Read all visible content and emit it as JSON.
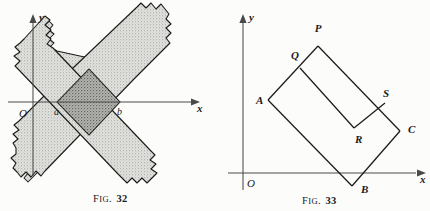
{
  "page": {
    "width": 430,
    "height": 211,
    "background": "#fcfcfa",
    "ink": "#1b1b1b"
  },
  "colors": {
    "ink": "#1b1b1b",
    "axis": "#4a4a4a",
    "strip_fill_light": "#dcdcd8",
    "strip_fill_dark": "#a9a9a6",
    "stipple_dot": "#6e6e6a"
  },
  "figures": [
    {
      "id": "fig32",
      "caption_prefix": "F",
      "caption_small": "IG.",
      "caption_number": "32",
      "caption_full": "FIG. 32",
      "axes": {
        "origin_label": "O",
        "x_label": "x",
        "y_label": "y",
        "x_axis_y": 102,
        "y_axis_x": 33,
        "x_axis_from": 8,
        "x_axis_to": 196,
        "y_axis_from": 18,
        "y_axis_to": 176
      },
      "point_labels": [
        {
          "name": "a",
          "text": "a",
          "x": 57,
          "y": 110
        },
        {
          "name": "b",
          "text": "b",
          "x": 120,
          "y": 110
        }
      ],
      "description": "Two infinite crossing diagonal strips, lightly stippled, whose overlap is a darker shaded square meeting the x-axis at a and b.",
      "geometry": {
        "strip_up": {
          "note": "strip rising to the right, corners along lines y = x + c",
          "outline": "18,60 47,31 199,22 198,76",
          "edge_low": [
            [
              18,
              60
            ],
            [
              160,
              180
            ]
          ],
          "edge_high": [
            [
              55,
              25
            ],
            [
              200,
              150
            ]
          ]
        },
        "strip_down": {
          "note": "strip falling to the right",
          "edge_low": [
            [
              55,
              180
            ],
            [
              200,
              40
            ]
          ],
          "edge_high": [
            [
              18,
              150
            ],
            [
              160,
              20
            ]
          ]
        },
        "overlap_square": [
          [
            57,
            102
          ],
          [
            89,
            69
          ],
          [
            120,
            102
          ],
          [
            89,
            135
          ]
        ]
      }
    },
    {
      "id": "fig33",
      "caption_prefix": "F",
      "caption_small": "IG.",
      "caption_number": "33",
      "caption_full": "FIG. 33",
      "axes": {
        "origin_label": "O",
        "x_label": "x",
        "y_label": "y",
        "x_axis_y": 173,
        "y_axis_x": 243,
        "x_axis_from": 228,
        "x_axis_to": 424,
        "y_axis_from": 18,
        "y_axis_to": 190
      },
      "vertices": [
        {
          "name": "P",
          "text": "P",
          "px": 318,
          "py": 46,
          "lx": 318,
          "ly": 32
        },
        {
          "name": "Q",
          "text": "Q",
          "px": 300,
          "py": 68,
          "lx": 291,
          "ly": 59
        },
        {
          "name": "A",
          "text": "A",
          "px": 268,
          "py": 100,
          "lx": 256,
          "ly": 104
        },
        {
          "name": "S",
          "text": "S",
          "px": 385,
          "py": 103,
          "lx": 383,
          "ly": 97
        },
        {
          "name": "R",
          "text": "R",
          "px": 354,
          "py": 128,
          "lx": 355,
          "ly": 143
        },
        {
          "name": "C",
          "text": "C",
          "px": 400,
          "py": 131,
          "lx": 408,
          "ly": 133
        },
        {
          "name": "B",
          "text": "B",
          "px": 352,
          "py": 186,
          "lx": 361,
          "ly": 193
        }
      ],
      "description": "A large tilted square A-P-C-B with an inner re-entrant notch Q-R-S, drawn relative to x- and y-axes with origin O.",
      "geometry": {
        "outer_path": [
          [
            268,
            100
          ],
          [
            318,
            46
          ],
          [
            400,
            131
          ],
          [
            352,
            186
          ]
        ],
        "notch_path": [
          [
            300,
            68
          ],
          [
            354,
            128
          ],
          [
            385,
            103
          ]
        ],
        "closing_edges": [
          [
            [
              268,
              100
            ],
            [
              352,
              186
            ]
          ],
          [
            [
              400,
              131
            ],
            [
              352,
              186
            ]
          ]
        ]
      }
    }
  ]
}
